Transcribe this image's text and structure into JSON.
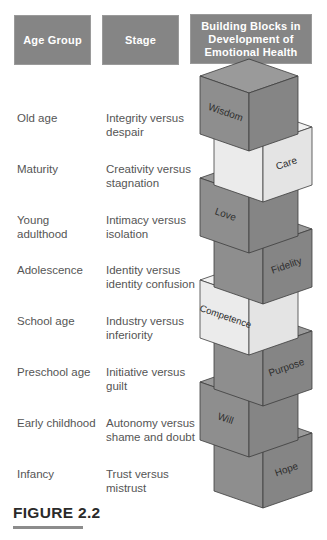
{
  "headers": {
    "age_group": "Age Group",
    "stage": "Stage",
    "building_blocks": "Building Blocks in Development of Emotional Health"
  },
  "rows": [
    {
      "age": "Old age",
      "stage_line1": "Integrity versus",
      "stage_line2": "despair",
      "block": "Wisdom",
      "shade": "dark",
      "label_face": "left"
    },
    {
      "age": "Maturity",
      "stage_line1": "Creativity versus",
      "stage_line2": "stagnation",
      "block": "Care",
      "shade": "light",
      "label_face": "right"
    },
    {
      "age": "Young adulthood",
      "stage_line1": "Intimacy versus",
      "stage_line2": "isolation",
      "block": "Love",
      "shade": "dark",
      "label_face": "left"
    },
    {
      "age": "Adolescence",
      "stage_line1": "Identity versus",
      "stage_line2": "identity confusion",
      "block": "Fidelity",
      "shade": "dark",
      "label_face": "right"
    },
    {
      "age": "School age",
      "stage_line1": "Industry versus",
      "stage_line2": "inferiority",
      "block": "Competence",
      "shade": "light",
      "label_face": "left"
    },
    {
      "age": "Preschool age",
      "stage_line1": "Initiative versus",
      "stage_line2": "guilt",
      "block": "Purpose",
      "shade": "dark",
      "label_face": "right"
    },
    {
      "age": "Early childhood",
      "stage_line1": "Autonomy versus",
      "stage_line2": "shame and doubt",
      "block": "Will",
      "shade": "dark",
      "label_face": "left"
    },
    {
      "age": "Infancy",
      "stage_line1": "Trust versus",
      "stage_line2": "mistrust",
      "block": "Hope",
      "shade": "dark",
      "label_face": "right"
    }
  ],
  "figure_label": "FIGURE 2.2",
  "colors": {
    "header_bg": "#858585",
    "dark_top": "#9a9a9a",
    "dark_left": "#8e8e8e",
    "dark_right": "#858585",
    "light_top": "#f2f2f2",
    "light_left": "#ebebeb",
    "light_right": "#e4e4e4",
    "edge": "#3c3c3c"
  }
}
